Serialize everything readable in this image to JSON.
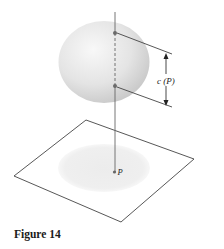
{
  "figure": {
    "caption": "Figure 14",
    "labels": {
      "distance": "c (P)",
      "point": "P"
    }
  },
  "diagram": {
    "elements": [
      "sphere",
      "plane",
      "vertical-line",
      "upper-intersection-point",
      "lower-intersection-point",
      "point-P",
      "dimension-arrow",
      "shadow-disk"
    ]
  },
  "colors": {
    "line": "#555555",
    "sphere_light": "#f6f6f6",
    "sphere_dark": "#c9c9c9",
    "shadow": "#ececec",
    "point": "#666666"
  }
}
